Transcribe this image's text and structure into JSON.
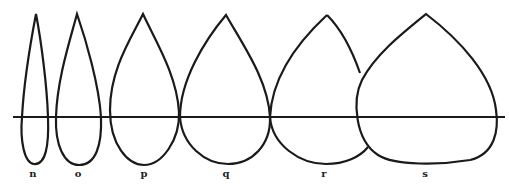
{
  "figure": {
    "line_color": "#1a1a1a",
    "background": "#ffffff",
    "labels": [
      {
        "text": "n",
        "x": 33
      },
      {
        "text": "o",
        "x": 78
      },
      {
        "text": "p",
        "x": 144
      },
      {
        "text": "q",
        "x": 226
      },
      {
        "text": "r",
        "x": 324
      },
      {
        "text": "s",
        "x": 425
      }
    ]
  }
}
